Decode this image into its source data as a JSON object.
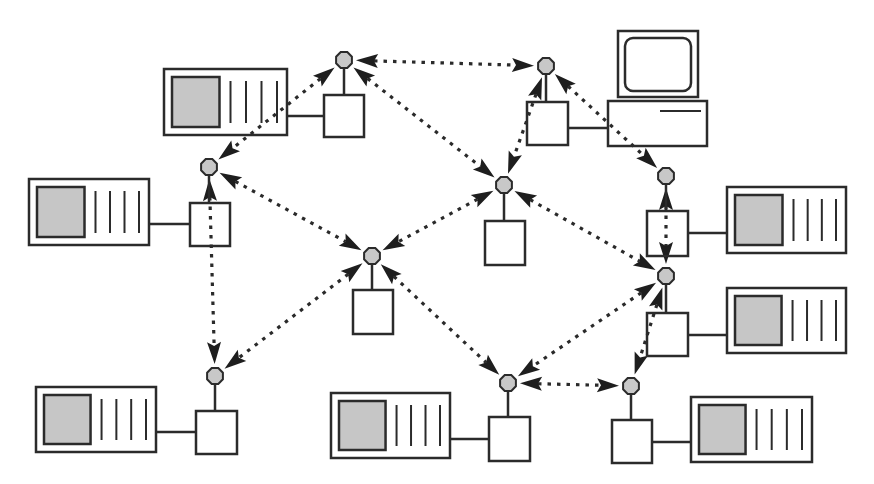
{
  "diagram": {
    "type": "network-topology",
    "colors": {
      "stroke": "#2b2b2b",
      "node_fill": "#c8c8c8",
      "screen_fill": "#c6c6c6",
      "background": "#ffffff"
    },
    "nodes": [
      {
        "id": "n1",
        "x": 344,
        "y": 60,
        "box": [
          324,
          95,
          40,
          42
        ],
        "host": {
          "type": "server",
          "rect": [
            164,
            69,
            123,
            66
          ],
          "link_y": 116
        }
      },
      {
        "id": "n2",
        "x": 546,
        "y": 66,
        "box": [
          527,
          102,
          41,
          43
        ],
        "host": {
          "type": "workstation",
          "rect": [
            608,
            31,
            99,
            115
          ],
          "link_y": 128
        }
      },
      {
        "id": "n3",
        "x": 209,
        "y": 167,
        "box": [
          190,
          203,
          40,
          43
        ],
        "host": {
          "type": "server",
          "rect": [
            29,
            179,
            120,
            66
          ],
          "link_y": 224
        }
      },
      {
        "id": "n4",
        "x": 504,
        "y": 185,
        "box": [
          485,
          221,
          40,
          44
        ],
        "host": null
      },
      {
        "id": "n5",
        "x": 666,
        "y": 176,
        "box": [
          647,
          211,
          41,
          45
        ],
        "host": {
          "type": "server",
          "rect": [
            727,
            187,
            119,
            66
          ],
          "link_y": 233
        }
      },
      {
        "id": "n6",
        "x": 372,
        "y": 256,
        "box": [
          353,
          290,
          40,
          44
        ],
        "host": null
      },
      {
        "id": "n7",
        "x": 666,
        "y": 276,
        "box": [
          647,
          313,
          41,
          43
        ],
        "host": {
          "type": "server",
          "rect": [
            727,
            288,
            119,
            65
          ],
          "link_y": 335
        }
      },
      {
        "id": "n8",
        "x": 215,
        "y": 376,
        "box": [
          196,
          411,
          41,
          43
        ],
        "host": {
          "type": "server",
          "rect": [
            36,
            387,
            120,
            65
          ],
          "link_y": 432
        }
      },
      {
        "id": "n9",
        "x": 508,
        "y": 383,
        "box": [
          489,
          417,
          41,
          44
        ],
        "host": {
          "type": "server",
          "rect": [
            331,
            393,
            119,
            65
          ],
          "link_y": 439
        }
      },
      {
        "id": "n10",
        "x": 631,
        "y": 386,
        "box": [
          612,
          420,
          40,
          43
        ],
        "host": {
          "type": "server",
          "rect": [
            691,
            397,
            121,
            65
          ],
          "link_y": 442
        }
      }
    ],
    "links": [
      {
        "from": "n1",
        "to": "n2"
      },
      {
        "from": "n1",
        "to": "n3"
      },
      {
        "from": "n1",
        "to": "n4"
      },
      {
        "from": "n2",
        "to": "n4"
      },
      {
        "from": "n2",
        "to": "n5"
      },
      {
        "from": "n3",
        "to": "n6"
      },
      {
        "from": "n3",
        "to": "n8"
      },
      {
        "from": "n4",
        "to": "n6"
      },
      {
        "from": "n4",
        "to": "n7"
      },
      {
        "from": "n5",
        "to": "n7"
      },
      {
        "from": "n6",
        "to": "n8"
      },
      {
        "from": "n6",
        "to": "n9"
      },
      {
        "from": "n7",
        "to": "n9"
      },
      {
        "from": "n7",
        "to": "n10"
      },
      {
        "from": "n9",
        "to": "n10"
      }
    ]
  }
}
